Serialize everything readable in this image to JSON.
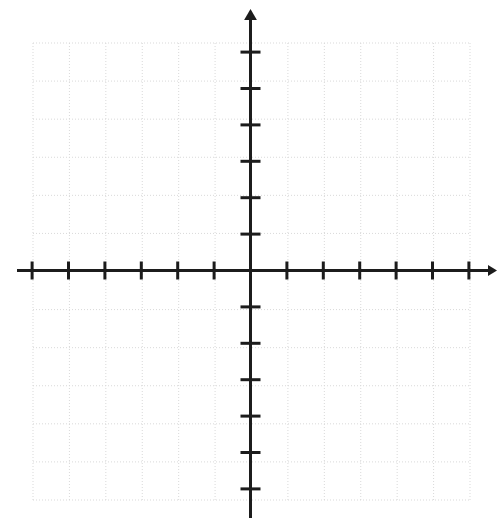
{
  "page": {
    "background_color": "#ffffff",
    "width": 503,
    "height": 525
  },
  "chart_data": {
    "type": "scatter",
    "title": "",
    "subtitle": "",
    "xlabel": "",
    "ylabel": "",
    "annotations": [],
    "legend": {
      "entries": [],
      "position": "none",
      "visible": false
    },
    "series": [],
    "x": [],
    "values": [],
    "xlim": [
      -6,
      6
    ],
    "ylim": [
      -6,
      6
    ],
    "x_tick_labels": [],
    "y_tick_labels": [],
    "x_ticks": [
      -6,
      -5,
      -4,
      -3,
      -2,
      -1,
      1,
      2,
      3,
      4,
      5,
      6
    ],
    "y_ticks": [
      -6,
      -5,
      -4,
      -3,
      -2,
      -1,
      1,
      2,
      3,
      4,
      5,
      6
    ],
    "tick_labels_visible": false,
    "grid": true,
    "grid_style": "dotted",
    "grid_columns": 12,
    "grid_rows": 12,
    "origin_marked": false
  },
  "geometry": {
    "grid_left": 33,
    "grid_right": 470,
    "grid_top": 43,
    "grid_bottom": 500,
    "cell_size": 36.4,
    "origin_x": 250.5,
    "origin_y": 270.5,
    "x_axis_start": 17,
    "x_axis_end": 497,
    "y_axis_start": 9,
    "y_axis_end": 518,
    "tick_half_length_x": 9,
    "tick_half_length_y": 10,
    "axis_stroke_width": 3,
    "tick_stroke_width": 3,
    "grid_stroke_width": 1,
    "arrow_size": 9
  },
  "colors": {
    "axis": "#1c1c1c",
    "tick": "#1c1c1c",
    "grid": "#d9d9d9",
    "grid_dash": "1 2",
    "background": "#ffffff"
  },
  "axes": {
    "x_axis_name": "x-axis",
    "y_axis_name": "y-axis",
    "x_arrow_direction": "right",
    "y_arrow_direction": "up",
    "x_arrow_visible": true,
    "y_arrow_visible": true,
    "x_left_arrow_visible": false,
    "y_down_arrow_visible": false
  }
}
